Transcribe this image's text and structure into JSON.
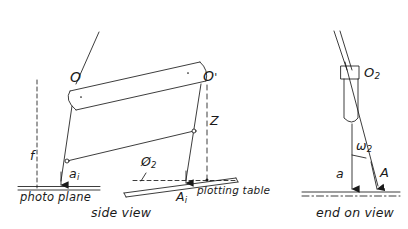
{
  "figure": {
    "type": "technical-line-diagram",
    "stroke_color": "#1a1a1a",
    "background_color": "#ffffff",
    "views": [
      "side view",
      "end on view"
    ]
  },
  "labels": {
    "o_left": "O",
    "o_right": "O'",
    "o_right_prime": "'",
    "f": "f",
    "z": "Z",
    "a_lower": "a",
    "a_lower_sub": "i",
    "a_upper": "A",
    "a_upper_sub": "i",
    "phi": "Ø",
    "phi_sub": "2",
    "omega": "ω",
    "omega_sub": "2",
    "o2": "O",
    "o2_sub": "2",
    "a_plain_lower": "a",
    "a_plain_upper": "A"
  },
  "captions": {
    "photo_plane": "photo plane",
    "plotting_table": "plotting table",
    "side_view": "side view",
    "end_on_view": "end on view"
  }
}
